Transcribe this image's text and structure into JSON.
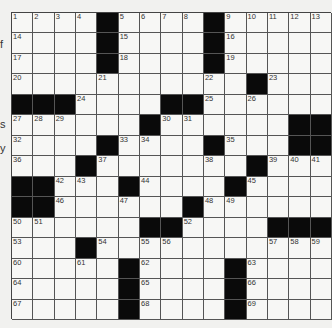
{
  "side_fragments": [
    {
      "text": "f",
      "top": 38
    },
    {
      "text": "s",
      "top": 118
    },
    {
      "text": "y",
      "top": 142
    }
  ],
  "puzzle": {
    "rows": 15,
    "cols": 15,
    "colors": {
      "block": "#0a0a0a",
      "cell": "#f7f7f5",
      "line": "#555555"
    },
    "grid": [
      [
        "1",
        "2",
        "3",
        "4",
        "#",
        "5",
        "6",
        "7",
        "8",
        "#",
        "9",
        "10",
        "11",
        "12",
        "13"
      ],
      [
        "14",
        "",
        "",
        "",
        "#",
        "15",
        "",
        "",
        "",
        "#",
        "16",
        "",
        "",
        "",
        ""
      ],
      [
        "17",
        "",
        "",
        "",
        "#",
        "18",
        "",
        "",
        "",
        "#",
        "19",
        "",
        "",
        "",
        ""
      ],
      [
        "20",
        "",
        "",
        "",
        "21",
        "",
        "",
        "",
        "",
        "22",
        "",
        "#",
        "23",
        "",
        ""
      ],
      [
        "#",
        "#",
        "#",
        "24",
        "",
        "",
        "",
        "#",
        "#",
        "25",
        "",
        "26",
        "",
        "",
        ""
      ],
      [
        "27",
        "28",
        "29",
        "",
        "",
        "",
        "#",
        "30",
        "31",
        "",
        "",
        "",
        "",
        "#",
        "#"
      ],
      [
        "32",
        "",
        "",
        "",
        "#",
        "33",
        "34",
        "",
        "",
        "#",
        "35",
        "",
        "",
        "#",
        "#"
      ],
      [
        "36",
        "",
        "",
        "#",
        "37",
        "",
        "",
        "",
        "",
        "38",
        "",
        "#",
        "39",
        "40",
        "41"
      ],
      [
        "#",
        "#",
        "42",
        "43",
        "",
        "#",
        "44",
        "",
        "",
        "",
        "#",
        "45",
        "",
        "",
        ""
      ],
      [
        "#",
        "#",
        "46",
        "",
        "",
        "47",
        "",
        "",
        "#",
        "48",
        "49",
        "",
        "",
        "",
        ""
      ],
      [
        "50",
        "51",
        "",
        "",
        "",
        "",
        "#",
        "#",
        "52",
        "",
        "",
        "",
        "#",
        "#",
        "#"
      ],
      [
        "53",
        "",
        "",
        "#",
        "54",
        "",
        "55",
        "56",
        "",
        "",
        "",
        "",
        "57",
        "58",
        "59"
      ],
      [
        "60",
        "",
        "",
        "61",
        "",
        "#",
        "62",
        "",
        "",
        "",
        "#",
        "63",
        "",
        "",
        ""
      ],
      [
        "64",
        "",
        "",
        "",
        "",
        "#",
        "65",
        "",
        "",
        "",
        "#",
        "66",
        "",
        "",
        ""
      ],
      [
        "67",
        "",
        "",
        "",
        "",
        "#",
        "68",
        "",
        "",
        "",
        "#",
        "69",
        "",
        "",
        ""
      ]
    ]
  }
}
